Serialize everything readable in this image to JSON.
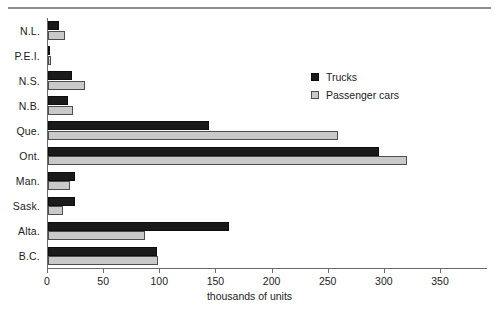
{
  "chart_data": {
    "type": "bar",
    "orientation": "horizontal",
    "title": "",
    "xlabel": "thousands of units",
    "ylabel": "",
    "xlim": [
      0,
      350
    ],
    "xticks": [
      0,
      50,
      100,
      150,
      200,
      250,
      300,
      350
    ],
    "grid": false,
    "legend_position": "upper right",
    "categories": [
      "N.L.",
      "P.E.I.",
      "N.S.",
      "N.B.",
      "Que.",
      "Ont.",
      "Man.",
      "Sask.",
      "Alta.",
      "B.C."
    ],
    "series": [
      {
        "name": "Trucks",
        "color": "#1a1a1a",
        "values": [
          10,
          2,
          21,
          18,
          143,
          295,
          24,
          24,
          161,
          97
        ]
      },
      {
        "name": "Passenger cars",
        "color": "#c9c9c9",
        "values": [
          15,
          3,
          33,
          22,
          258,
          320,
          20,
          13,
          86,
          98
        ]
      }
    ]
  },
  "legend": {
    "items": [
      {
        "label": "Trucks",
        "swatch": "trucks-swatch"
      },
      {
        "label": "Passenger cars",
        "swatch": "passenger-cars-swatch"
      }
    ]
  }
}
